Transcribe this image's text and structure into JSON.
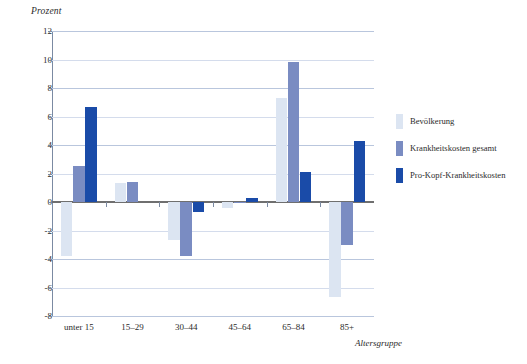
{
  "chart_data": {
    "type": "bar",
    "title": "",
    "ylabel": "Prozent",
    "xlabel": "Altersgruppe",
    "categories": [
      "unter 15",
      "15–29",
      "30–44",
      "45–64",
      "65–84",
      "85+"
    ],
    "ylim": [
      -8,
      12
    ],
    "yticks": [
      12,
      10,
      8,
      6,
      4,
      2,
      0,
      -2,
      -4,
      -6,
      -8
    ],
    "ytick_labels": [
      "12",
      "10",
      "8",
      "6",
      "4",
      "2",
      "0",
      "-2",
      "-4",
      "-6",
      "-8"
    ],
    "grid": true,
    "legend_position": "right",
    "series": [
      {
        "name": "Bevölkerung",
        "color": "#dce5f2",
        "values": [
          -3.8,
          1.3,
          -2.7,
          -0.4,
          7.3,
          -6.7
        ]
      },
      {
        "name": "Krankheitskosten gesamt",
        "color": "#7a8cc2",
        "values": [
          2.5,
          1.4,
          -3.8,
          -0.1,
          9.8,
          -3.0
        ]
      },
      {
        "name": "Pro-Kopf-Krankheitskosten",
        "color": "#1a4ba8",
        "values": [
          6.7,
          0.0,
          -0.7,
          0.3,
          2.1,
          4.3
        ]
      }
    ]
  },
  "colors": {
    "axis": "#7b8aa2",
    "grid": "#b9c6dd",
    "zero": "#6f6f6f",
    "text": "#2b2b2b",
    "background": "#ffffff"
  }
}
